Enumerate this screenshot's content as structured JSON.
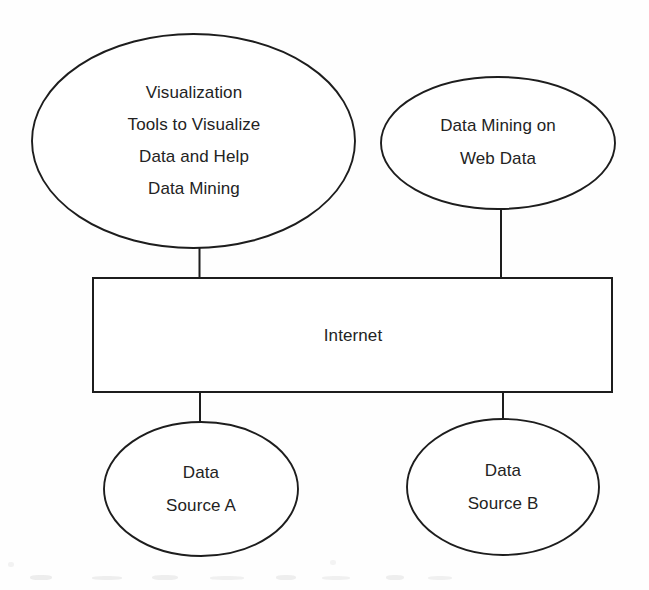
{
  "diagram": {
    "background_color": "#fefefe",
    "stroke_color": "#1d1d1d",
    "text_color": "#232323",
    "nodes": [
      {
        "id": "visualization-tools",
        "shape": "ellipse",
        "lines": [
          "Visualization",
          "Tools to Visualize",
          "Data and Help",
          "Data Mining"
        ]
      },
      {
        "id": "data-mining-web",
        "shape": "ellipse",
        "lines": [
          "Data Mining on",
          "Web Data"
        ]
      },
      {
        "id": "internet",
        "shape": "rectangle",
        "lines": [
          "Internet"
        ]
      },
      {
        "id": "data-source-a",
        "shape": "ellipse",
        "lines": [
          "Data",
          "Source A"
        ]
      },
      {
        "id": "data-source-b",
        "shape": "ellipse",
        "lines": [
          "Data",
          "Source B"
        ]
      }
    ],
    "connectors": [
      {
        "id": "visualization-to-internet",
        "from": "visualization-tools",
        "to": "internet"
      },
      {
        "id": "webmining-to-internet",
        "from": "data-mining-web",
        "to": "internet"
      },
      {
        "id": "internet-to-source-a",
        "from": "internet",
        "to": "data-source-a"
      },
      {
        "id": "internet-to-source-b",
        "from": "internet",
        "to": "data-source-b"
      }
    ],
    "labels": {
      "visualization_line1": "Visualization",
      "visualization_line2": "Tools to Visualize",
      "visualization_line3": "Data and Help",
      "visualization_line4": "Data Mining",
      "webmining_line1": "Data Mining on",
      "webmining_line2": "Web Data",
      "internet_line1": "Internet",
      "source_a_line1": "Data",
      "source_a_line2": "Source A",
      "source_b_line1": "Data",
      "source_b_line2": "Source B"
    }
  }
}
